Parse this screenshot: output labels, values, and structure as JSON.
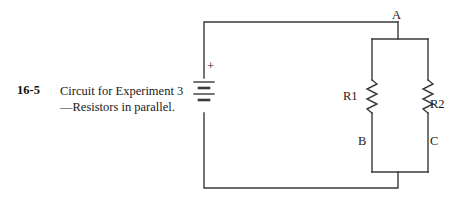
{
  "figure": {
    "number": "16-5",
    "caption": "Circuit for Experiment 3—Resistors in parallel."
  },
  "circuit": {
    "nodes": [
      {
        "id": "A",
        "label": "A"
      },
      {
        "id": "B",
        "label": "B"
      },
      {
        "id": "C",
        "label": "C"
      }
    ],
    "components": [
      {
        "id": "R1",
        "label": "R1",
        "type": "resistor"
      },
      {
        "id": "R2",
        "label": "R2",
        "type": "resistor"
      },
      {
        "id": "BAT1",
        "label": "+",
        "type": "battery"
      }
    ],
    "polarity_marker": "+",
    "wire_color": "#3a3a3a",
    "line_width": 1.4
  }
}
